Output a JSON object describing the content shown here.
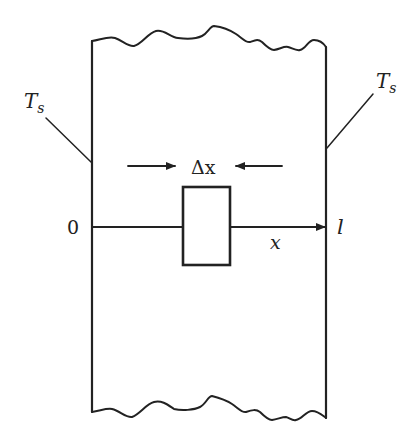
{
  "diagram": {
    "colors": {
      "ink": "#222222",
      "background": "#ffffff"
    },
    "labels": {
      "left_surface_temp": {
        "main": "T",
        "sub": "s"
      },
      "right_surface_temp": {
        "main": "T",
        "sub": "s"
      },
      "element_width": "Δx",
      "origin": "0",
      "thickness": "l",
      "axis": "x"
    },
    "elements": {
      "slab": "slab-region",
      "control_volume": "control-volume-box",
      "x_axis": "x-axis-arrow",
      "delta_arrows": [
        "left-pointing-in-arrow",
        "right-pointing-in-arrow"
      ]
    }
  }
}
